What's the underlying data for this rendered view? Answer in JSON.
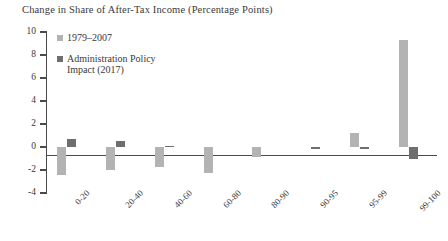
{
  "chart_data": {
    "type": "bar",
    "title": "Change in Share of After-Tax Income (Percentage Points)",
    "xlabel": "",
    "ylabel": "",
    "ylim": [
      -4,
      10
    ],
    "yticks": [
      10,
      8,
      6,
      4,
      2,
      0,
      -2,
      -4
    ],
    "ytick_labels": [
      "10",
      "8",
      "6",
      "4",
      "2",
      "0",
      "-2",
      "-4"
    ],
    "grid": false,
    "legend_position": "top-left-inside",
    "categories": [
      "0-20",
      "20-40",
      "40-60",
      "60-80",
      "80-90",
      "90-95",
      "95-99",
      "99-100"
    ],
    "series": [
      {
        "name": "1979–2007",
        "color": "#b3b3b3",
        "values": [
          -2.4,
          -2.0,
          -1.7,
          -2.3,
          -0.9,
          0.0,
          1.2,
          9.3
        ]
      },
      {
        "name": "Administration Policy Impact (2017)",
        "color": "#6e6e6e",
        "values": [
          0.7,
          0.5,
          0.1,
          0.0,
          0.0,
          -0.15,
          -0.2,
          -1.0
        ]
      }
    ]
  }
}
